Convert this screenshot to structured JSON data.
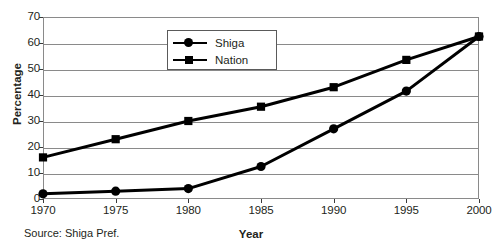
{
  "chart_data": {
    "type": "line",
    "title": "",
    "xlabel": "Year",
    "ylabel": "Percentage",
    "x": [
      1970,
      1975,
      1980,
      1985,
      1990,
      1995,
      2000
    ],
    "xticklabels": [
      "1970",
      "1975",
      "1980",
      "1985",
      "1990",
      "1995",
      "2000"
    ],
    "yticklabels": [
      "0",
      "10",
      "20",
      "30",
      "40",
      "50",
      "60",
      "70"
    ],
    "yticks": [
      0,
      10,
      20,
      30,
      40,
      50,
      60,
      70
    ],
    "ylim": [
      0,
      70
    ],
    "xlim": [
      1970,
      2000
    ],
    "grid": "horizontal",
    "legend_position": "upper-center-left",
    "series": [
      {
        "name": "Shiga",
        "marker": "circle",
        "color": "#000000",
        "values": [
          2,
          3,
          4,
          12.5,
          27,
          41.5,
          62.5
        ]
      },
      {
        "name": "Nation",
        "marker": "square",
        "color": "#000000",
        "values": [
          16,
          23,
          30,
          35.5,
          43,
          53.5,
          62.5
        ]
      }
    ],
    "source": "Source: Shiga Pref."
  },
  "legend": {
    "items": [
      {
        "label": "Shiga"
      },
      {
        "label": "Nation"
      }
    ]
  },
  "colors": {
    "ink": "#231f20",
    "grid": "#8a8a8a",
    "series": "#000000"
  }
}
